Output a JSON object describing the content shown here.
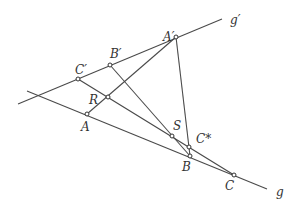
{
  "diagram": {
    "type": "projective-geometry",
    "lines": [
      {
        "id": "g",
        "label": "g",
        "through": [
          "A",
          "B",
          "C"
        ]
      },
      {
        "id": "g_prime",
        "label": "g′",
        "through": [
          "C'",
          "B'",
          "A'"
        ]
      },
      {
        "id": "AA'",
        "through": [
          "A",
          "R",
          "A'"
        ]
      },
      {
        "id": "C'C",
        "through": [
          "C'",
          "R",
          "S",
          "C*",
          "C"
        ]
      },
      {
        "id": "B'B",
        "through": [
          "B'",
          "S",
          "B"
        ]
      },
      {
        "id": "A'B",
        "through": [
          "A'",
          "C*",
          "B"
        ]
      }
    ],
    "points": [
      {
        "id": "A",
        "label": "A"
      },
      {
        "id": "B",
        "label": "B"
      },
      {
        "id": "C",
        "label": "C"
      },
      {
        "id": "A'",
        "label": "A′"
      },
      {
        "id": "B'",
        "label": "B′"
      },
      {
        "id": "C'",
        "label": "C′"
      },
      {
        "id": "R",
        "label": "R"
      },
      {
        "id": "S",
        "label": "S"
      },
      {
        "id": "C*",
        "label": "C*"
      }
    ],
    "colors": {
      "line": "#4a4a4a",
      "text": "#333333",
      "background": "#ffffff"
    }
  }
}
